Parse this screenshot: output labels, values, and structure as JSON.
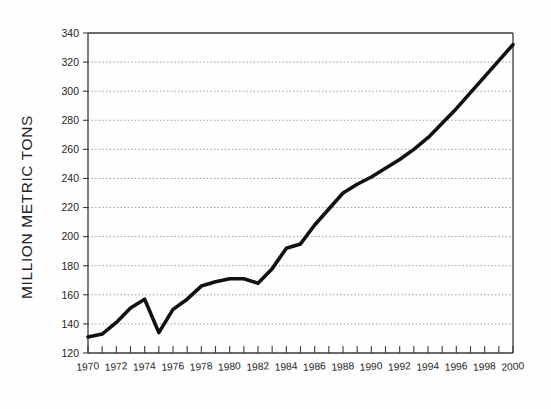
{
  "figure": {
    "background_color": "#fefefe",
    "line_color": "#111111",
    "grid_color": "#8d8d8d",
    "axis_color": "#3a3a3a"
  },
  "chart_data": {
    "type": "line",
    "title": "",
    "subtitle": "",
    "xlabel": "",
    "ylabel": "MILLION METRIC TONS",
    "xlim": [
      1970,
      2000
    ],
    "ylim": [
      120,
      340
    ],
    "grid": true,
    "legend": false,
    "legend_position": "none",
    "y_ticks": [
      120,
      140,
      160,
      180,
      200,
      220,
      240,
      260,
      280,
      300,
      320,
      340
    ],
    "y_tick_labels": [
      "120",
      "140",
      "160",
      "180",
      "200",
      "220",
      "240",
      "260",
      "280",
      "300",
      "320",
      "340"
    ],
    "x_ticks": [
      1970,
      1971,
      1972,
      1973,
      1974,
      1975,
      1976,
      1977,
      1978,
      1979,
      1980,
      1981,
      1982,
      1983,
      1984,
      1985,
      1986,
      1987,
      1988,
      1989,
      1990,
      1991,
      1992,
      1993,
      1994,
      1995,
      1996,
      1997,
      1998,
      1999,
      2000
    ],
    "x_tick_labels": [
      "1970",
      "1972",
      "1974",
      "1976",
      "1978",
      "1980",
      "1982",
      "1984",
      "1986",
      "1988",
      "1990",
      "1992",
      "1994",
      "1996",
      "1998",
      "2000"
    ],
    "x_tick_label_years": [
      1970,
      1972,
      1974,
      1976,
      1978,
      1980,
      1982,
      1984,
      1986,
      1988,
      1990,
      1992,
      1994,
      1996,
      1998,
      2000
    ],
    "x": [
      1970,
      1971,
      1972,
      1973,
      1974,
      1975,
      1976,
      1977,
      1978,
      1979,
      1980,
      1981,
      1982,
      1983,
      1984,
      1985,
      1986,
      1987,
      1988,
      1989,
      1990,
      1991,
      1992,
      1993,
      1994,
      1995,
      1996,
      1997,
      1998,
      1999,
      2000
    ],
    "values": [
      131,
      133,
      141,
      151,
      157,
      134,
      150,
      157,
      166,
      169,
      171,
      171,
      168,
      178,
      192,
      195,
      208,
      219,
      230,
      236,
      241,
      247,
      253,
      260,
      268,
      278,
      288,
      299,
      310,
      321,
      332
    ],
    "series": [
      {
        "name": "Million metric tons",
        "values": [
          131,
          133,
          141,
          151,
          157,
          134,
          150,
          157,
          166,
          169,
          171,
          171,
          168,
          178,
          192,
          195,
          208,
          219,
          230,
          236,
          241,
          247,
          253,
          260,
          268,
          278,
          288,
          299,
          310,
          321,
          332
        ]
      }
    ]
  }
}
